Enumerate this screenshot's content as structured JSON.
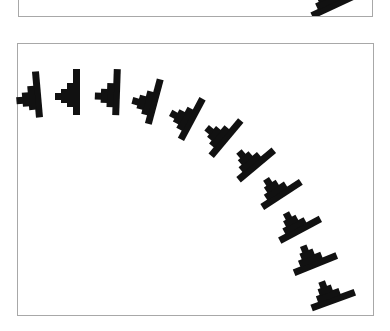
{
  "colors": {
    "glyph": "#111111",
    "frame_border": "#a8a8a8",
    "background": "#ffffff"
  },
  "top_panel": {
    "glyph": {
      "name": "stair-glyph-partial",
      "x": 330,
      "y": 0,
      "rotation": -25
    }
  },
  "main_panel": {
    "glyphs": [
      {
        "x": 31,
        "y": 95,
        "rotation": -95
      },
      {
        "x": 70,
        "y": 92,
        "rotation": -90
      },
      {
        "x": 110,
        "y": 92,
        "rotation": -88
      },
      {
        "x": 148,
        "y": 100,
        "rotation": -75
      },
      {
        "x": 186,
        "y": 116,
        "rotation": -62
      },
      {
        "x": 221,
        "y": 134,
        "rotation": -50
      },
      {
        "x": 252,
        "y": 160,
        "rotation": -40
      },
      {
        "x": 278,
        "y": 189,
        "rotation": -33
      },
      {
        "x": 297,
        "y": 224,
        "rotation": -28
      },
      {
        "x": 313,
        "y": 258,
        "rotation": -22
      },
      {
        "x": 331,
        "y": 294,
        "rotation": -20
      }
    ]
  }
}
